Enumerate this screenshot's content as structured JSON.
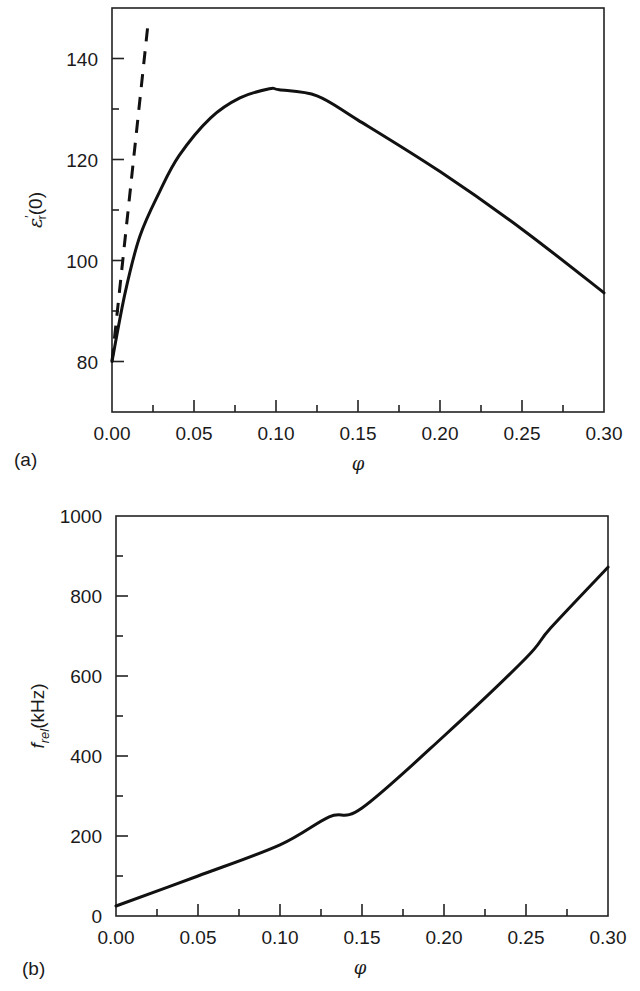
{
  "chart_data": [
    {
      "id": "a",
      "type": "line",
      "panel_label": "(a)",
      "title": "",
      "xlabel": "φ",
      "ylabel": "ε′r(0)",
      "ylabel_main": "ε",
      "ylabel_sup": "′",
      "ylabel_sub": "r",
      "ylabel_tail": "(0)",
      "xlim": [
        0.0,
        0.3
      ],
      "ylim": [
        70,
        150
      ],
      "grid": false,
      "legend": null,
      "x_ticks": [
        "0.00",
        "0.05",
        "0.10",
        "0.15",
        "0.20",
        "0.25",
        "0.30"
      ],
      "y_ticks": [
        "80",
        "100",
        "120",
        "140"
      ],
      "series": [
        {
          "name": "full curve",
          "style": "solid",
          "x": [
            0.0,
            0.008,
            0.017,
            0.029,
            0.041,
            0.06,
            0.078,
            0.096,
            0.102,
            0.125,
            0.15,
            0.2,
            0.25,
            0.3
          ],
          "y": [
            80,
            93.6,
            104.8,
            113.6,
            120.8,
            128.2,
            132.2,
            134.0,
            133.8,
            132.6,
            127.8,
            117.6,
            106.2,
            93.6
          ]
        },
        {
          "name": "low-concentration limit",
          "style": "dashed",
          "x": [
            0.0,
            0.022
          ],
          "y": [
            80,
            147
          ]
        }
      ]
    },
    {
      "id": "b",
      "type": "line",
      "panel_label": "(b)",
      "title": "",
      "xlabel": "φ",
      "ylabel": "f_rel(kHz)",
      "ylabel_main": "f",
      "ylabel_sub": "rel",
      "ylabel_tail": "(kHz)",
      "xlim": [
        0.0,
        0.3
      ],
      "ylim": [
        0,
        1000
      ],
      "grid": false,
      "legend": null,
      "x_ticks": [
        "0.00",
        "0.05",
        "0.10",
        "0.15",
        "0.20",
        "0.25",
        "0.30"
      ],
      "y_ticks": [
        "0",
        "200",
        "400",
        "600",
        "800",
        "1000"
      ],
      "series": [
        {
          "name": "relaxation frequency",
          "style": "solid",
          "x": [
            0.0,
            0.05,
            0.1,
            0.13,
            0.15,
            0.2,
            0.25,
            0.265,
            0.3
          ],
          "y": [
            25,
            100,
            178,
            248,
            270,
            450,
            645,
            720,
            872
          ]
        }
      ]
    }
  ]
}
